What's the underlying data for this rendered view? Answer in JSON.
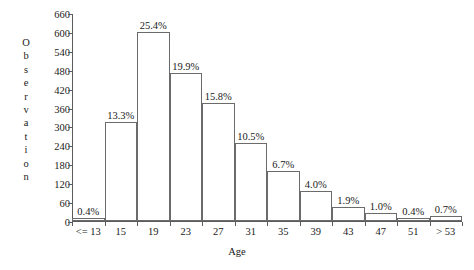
{
  "chart_data": {
    "type": "bar",
    "title": "",
    "subtitle": "",
    "xlabel": "Age",
    "ylabel": "Observation",
    "categories": [
      "<= 13",
      "15",
      "19",
      "23",
      "27",
      "31",
      "35",
      "39",
      "43",
      "47",
      "51",
      "> 53"
    ],
    "values": [
      10,
      314,
      600,
      470,
      373,
      248,
      158,
      94,
      45,
      24,
      9,
      17
    ],
    "data_labels": [
      "0.4%",
      "13.3%",
      "25.4%",
      "19.9%",
      "15.8%",
      "10.5%",
      "6.7%",
      "4.0%",
      "1.9%",
      "1.0%",
      "0.4%",
      "0.7%"
    ],
    "percent_values": [
      0.4,
      13.3,
      25.4,
      19.9,
      15.8,
      10.5,
      6.7,
      4.0,
      1.9,
      1.0,
      0.4,
      0.7
    ],
    "ylim": [
      0,
      660
    ],
    "yticks": [
      0,
      60,
      120,
      180,
      240,
      300,
      360,
      420,
      480,
      540,
      600,
      660
    ],
    "ytick_labels": [
      "0",
      "60",
      "120",
      "180",
      "240",
      "300",
      "360",
      "420",
      "480",
      "540",
      "600",
      "660"
    ],
    "grid": false,
    "legend": null,
    "legend_position": "none",
    "bar_fill_color": "#ffffff",
    "bar_edge_color": "#6b6b6b",
    "axis_color": "#5c5c5c",
    "text_color": "#1a1a1a",
    "background_color": "#ffffff"
  }
}
